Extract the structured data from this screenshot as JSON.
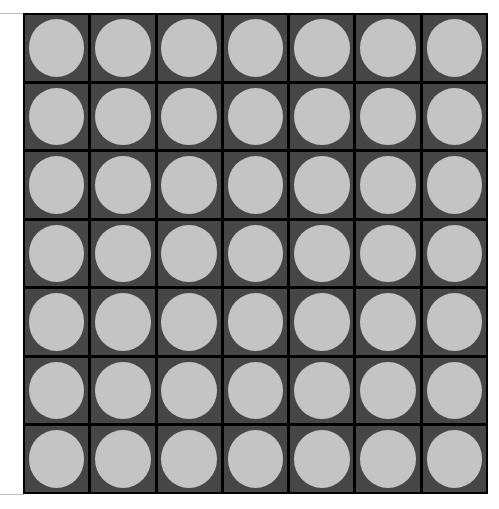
{
  "board": {
    "rows": 7,
    "cols": 7,
    "colors": {
      "cell_background": "#464646",
      "grid_lines": "#000000",
      "empty_slot": "#c4c4c4"
    },
    "cells": [
      [
        "empty",
        "empty",
        "empty",
        "empty",
        "empty",
        "empty",
        "empty"
      ],
      [
        "empty",
        "empty",
        "empty",
        "empty",
        "empty",
        "empty",
        "empty"
      ],
      [
        "empty",
        "empty",
        "empty",
        "empty",
        "empty",
        "empty",
        "empty"
      ],
      [
        "empty",
        "empty",
        "empty",
        "empty",
        "empty",
        "empty",
        "empty"
      ],
      [
        "empty",
        "empty",
        "empty",
        "empty",
        "empty",
        "empty",
        "empty"
      ],
      [
        "empty",
        "empty",
        "empty",
        "empty",
        "empty",
        "empty",
        "empty"
      ],
      [
        "empty",
        "empty",
        "empty",
        "empty",
        "empty",
        "empty",
        "empty"
      ]
    ]
  }
}
